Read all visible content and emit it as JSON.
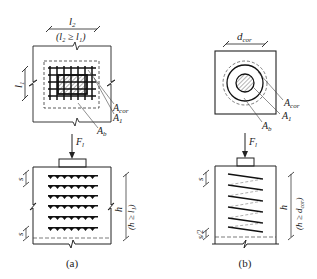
{
  "figure_a": {
    "top_dim_label": "l",
    "top_dim_sub": "2",
    "top_cond": "(l₂ ≥ l₁)",
    "left_dim_label": "l",
    "left_dim_sub": "1",
    "a_cor_label": "A",
    "a_cor_sub": "cor",
    "a1_label": "A",
    "a1_sub": "1",
    "ab_label": "A",
    "ab_sub": "b",
    "force_label": "F",
    "force_sub": "l",
    "spacing_top": "s",
    "spacing_bottom": "s",
    "height_label": "h",
    "height_cond": "(h ≥ l₁)",
    "caption": "(a)"
  },
  "figure_b": {
    "top_dim_label": "d",
    "top_dim_sub": "cor",
    "a_cor_label": "A",
    "a_cor_sub": "cor",
    "a1_label": "A",
    "a1_sub": "1",
    "ab_label": "A",
    "ab_sub": "b",
    "force_label": "F",
    "force_sub": "l",
    "spacing_top": "s",
    "spacing_bottom": "s/2",
    "height_label": "h",
    "height_cond": "(h ≥ d",
    "height_cond_sub": "cor",
    "height_cond_end": ")",
    "caption": "(b)"
  }
}
